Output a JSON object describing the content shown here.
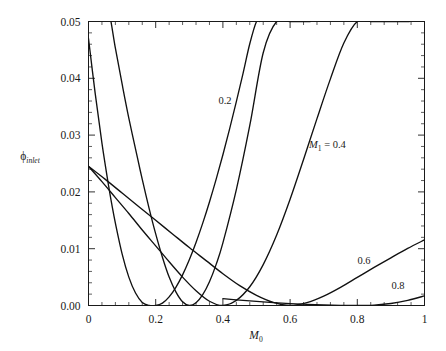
{
  "figure": {
    "title": "",
    "background": "#ffffff",
    "line_color": "#111111",
    "axis_color": "#1a1a1a"
  },
  "axes": {
    "x_title_symbol": "M",
    "x_title_subscript": "0",
    "y_title_symbol": "ϕ",
    "y_title_subscript": "inlet",
    "x_ticklabels": [
      "0",
      "0.2",
      "0.4",
      "0.6",
      "0.8",
      "1"
    ],
    "y_ticklabels": [
      "0.00",
      "0.01",
      "0.02",
      "0.03",
      "0.04",
      "0.05"
    ]
  },
  "annotations": {
    "label_02": "0.2",
    "label_series": "M",
    "label_series_sub": "1",
    "label_series_eq": " = 0.4",
    "label_06": "0.6",
    "label_08": "0.8"
  },
  "chart_data": {
    "type": "line",
    "title": "",
    "xlabel": "M_0",
    "ylabel": "phi_inlet",
    "xlim": [
      0,
      1
    ],
    "ylim": [
      0,
      0.05
    ],
    "grid": false,
    "legend": "inline-curve-labels",
    "x_ticks": [
      0,
      0.2,
      0.4,
      0.6,
      0.8,
      1
    ],
    "y_ticks": [
      0.0,
      0.01,
      0.02,
      0.03,
      0.04,
      0.05
    ],
    "x_minor_ticks_per_interval": 4,
    "y_minor_ticks_per_interval": 4,
    "series": [
      {
        "name": "0.2",
        "label": "0.2",
        "minimum_at_x": 0.2,
        "x": [
          0.0,
          0.02,
          0.04,
          0.06,
          0.07,
          0.08,
          0.1,
          0.12,
          0.14,
          0.16,
          0.18,
          0.2,
          0.22,
          0.24,
          0.26,
          0.28,
          0.3,
          0.32,
          0.34,
          0.36,
          0.38,
          0.4,
          0.42,
          0.44,
          0.46,
          0.48,
          0.5,
          0.51
        ],
        "y": [
          0.047,
          0.0373,
          0.0286,
          0.021,
          0.0176,
          0.0145,
          0.0091,
          0.005,
          0.0022,
          0.00055,
          2e-05,
          0.0,
          0.00042,
          0.00152,
          0.0032,
          0.0054,
          0.00805,
          0.0111,
          0.0145,
          0.01823,
          0.02225,
          0.02655,
          0.0311,
          0.03588,
          0.04088,
          0.04608,
          0.05,
          0.05
        ]
      },
      {
        "name": "0.3",
        "label": "",
        "minimum_at_x": 0.3,
        "x": [
          0.0,
          0.02,
          0.04,
          0.06,
          0.08,
          0.1,
          0.12,
          0.145,
          0.16,
          0.18,
          0.2,
          0.22,
          0.24,
          0.26,
          0.28,
          0.3,
          0.32,
          0.34,
          0.36,
          0.38,
          0.4,
          0.44,
          0.48,
          0.52,
          0.56,
          0.6,
          0.64,
          0.66
        ],
        "y": [
          0.074,
          0.0663,
          0.059,
          0.052,
          0.0453,
          0.039,
          0.033,
          0.0262,
          0.0222,
          0.0172,
          0.0126,
          0.0085,
          0.005,
          0.0024,
          0.00065,
          0.0,
          0.00048,
          0.0019,
          0.00418,
          0.00724,
          0.01102,
          0.0204,
          0.0317,
          0.0445,
          0.05,
          0.05,
          0.05,
          0.05
        ]
      },
      {
        "name": "0.4",
        "label": "M₁ = 0.4",
        "minimum_at_x": 0.4,
        "x": [
          0.0,
          0.04,
          0.08,
          0.12,
          0.16,
          0.2,
          0.24,
          0.28,
          0.32,
          0.36,
          0.4,
          0.44,
          0.48,
          0.52,
          0.56,
          0.6,
          0.64,
          0.68,
          0.72,
          0.76,
          0.8,
          0.84,
          0.88,
          0.92,
          0.955
        ],
        "y": [
          0.0245,
          0.0218,
          0.019,
          0.0162,
          0.0133,
          0.0105,
          0.0077,
          0.005,
          0.0026,
          0.00075,
          0.0,
          0.0009,
          0.0033,
          0.0072,
          0.0124,
          0.0187,
          0.0257,
          0.0329,
          0.0399,
          0.0462,
          0.05,
          0.05,
          0.05,
          0.05,
          0.05
        ]
      },
      {
        "name": "0.6",
        "label": "0.6",
        "minimum_at_x": 0.6,
        "x": [
          0.0,
          0.05,
          0.1,
          0.15,
          0.2,
          0.25,
          0.3,
          0.35,
          0.4,
          0.45,
          0.5,
          0.55,
          0.6,
          0.65,
          0.7,
          0.75,
          0.8,
          0.85,
          0.9,
          0.95,
          1.0
        ],
        "y": [
          0.0245,
          0.0222,
          0.0198,
          0.0174,
          0.015,
          0.0126,
          0.0102,
          0.0079,
          0.0056,
          0.0035,
          0.0018,
          0.00055,
          0.0,
          0.0005,
          0.00165,
          0.0032,
          0.00495,
          0.0067,
          0.0084,
          0.01005,
          0.01155
        ]
      },
      {
        "name": "0.8",
        "label": "0.8",
        "minimum_at_x": 0.8,
        "x": [
          0.4,
          0.45,
          0.5,
          0.55,
          0.6,
          0.65,
          0.7,
          0.75,
          0.8,
          0.85,
          0.9,
          0.95,
          1.0
        ],
        "y": [
          0.0012,
          0.00095,
          0.00072,
          0.00052,
          0.00034,
          0.0002,
          0.0001,
          3e-05,
          0.0,
          8e-05,
          0.00035,
          0.0009,
          0.0017
        ]
      }
    ]
  }
}
